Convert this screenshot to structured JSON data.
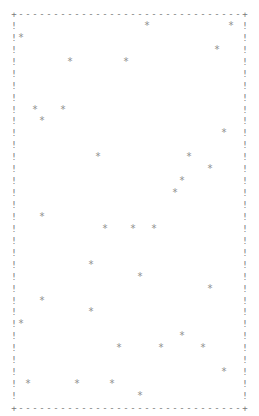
{
  "chart_data": {
    "type": "scatter",
    "title": "",
    "xlabel": "",
    "ylabel": "",
    "render": "ascii",
    "grid": false,
    "legend": null,
    "frame": {
      "corner_char": "+",
      "horizontal_char": "-",
      "vertical_char": "!",
      "columns": 34,
      "rows": 34
    },
    "marker_char": "*",
    "xlim": [
      0,
      32
    ],
    "ylim": [
      0,
      32
    ],
    "points": [
      {
        "x": 18,
        "y": 31
      },
      {
        "x": 30,
        "y": 31
      },
      {
        "x": 0,
        "y": 30
      },
      {
        "x": 28,
        "y": 29
      },
      {
        "x": 7,
        "y": 28
      },
      {
        "x": 15,
        "y": 28
      },
      {
        "x": 2,
        "y": 24
      },
      {
        "x": 6,
        "y": 24
      },
      {
        "x": 3,
        "y": 23
      },
      {
        "x": 29,
        "y": 22
      },
      {
        "x": 11,
        "y": 20
      },
      {
        "x": 24,
        "y": 20
      },
      {
        "x": 27,
        "y": 19
      },
      {
        "x": 23,
        "y": 18
      },
      {
        "x": 22,
        "y": 17
      },
      {
        "x": 3,
        "y": 15
      },
      {
        "x": 12,
        "y": 14
      },
      {
        "x": 16,
        "y": 14
      },
      {
        "x": 19,
        "y": 14
      },
      {
        "x": 10,
        "y": 11
      },
      {
        "x": 17,
        "y": 10
      },
      {
        "x": 27,
        "y": 9
      },
      {
        "x": 3,
        "y": 8
      },
      {
        "x": 10,
        "y": 7
      },
      {
        "x": 0,
        "y": 6
      },
      {
        "x": 23,
        "y": 5
      },
      {
        "x": 14,
        "y": 4
      },
      {
        "x": 20,
        "y": 4
      },
      {
        "x": 26,
        "y": 4
      },
      {
        "x": 29,
        "y": 2
      },
      {
        "x": 1,
        "y": 1
      },
      {
        "x": 8,
        "y": 1
      },
      {
        "x": 13,
        "y": 1
      },
      {
        "x": 17,
        "y": 0
      }
    ]
  },
  "colors": {
    "background": "#ffffff",
    "glyph": "#8a8a8a"
  }
}
